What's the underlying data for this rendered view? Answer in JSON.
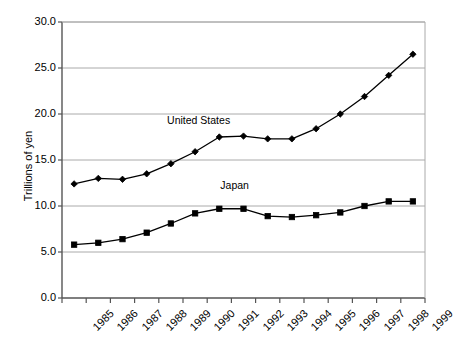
{
  "chart_data": {
    "type": "line",
    "title": "",
    "xlabel": "",
    "ylabel": "Trillions of yen",
    "categories": [
      "1985",
      "1986",
      "1987",
      "1988",
      "1989",
      "1990",
      "1991",
      "1992",
      "1993",
      "1994",
      "1995",
      "1996",
      "1997",
      "1998",
      "1999"
    ],
    "ylim": [
      0.0,
      30.0
    ],
    "ytick_labels": [
      "0.0",
      "5.0",
      "10.0",
      "15.0",
      "20.0",
      "25.0",
      "30.0"
    ],
    "ytick_values": [
      0.0,
      5.0,
      10.0,
      15.0,
      20.0,
      25.0,
      30.0
    ],
    "grid": "horizontal",
    "legend": "inline-annotation",
    "series": [
      {
        "name": "United States",
        "marker": "diamond",
        "color": "#000000",
        "label_x": 1990.0,
        "label_y": 19.2,
        "values": [
          12.4,
          13.0,
          12.9,
          13.5,
          14.6,
          15.9,
          17.5,
          17.6,
          17.3,
          17.3,
          18.4,
          20.0,
          21.9,
          24.2,
          26.5
        ]
      },
      {
        "name": "Japan",
        "marker": "square",
        "color": "#000000",
        "label_x": 1992.2,
        "label_y": 12.2,
        "values": [
          5.8,
          6.0,
          6.4,
          7.1,
          8.1,
          9.2,
          9.7,
          9.7,
          8.9,
          8.8,
          9.0,
          9.3,
          10.0,
          10.5,
          10.5
        ]
      }
    ]
  },
  "axis": {
    "plot_left": 62,
    "plot_right": 425,
    "plot_top": 22,
    "plot_bottom": 298
  }
}
